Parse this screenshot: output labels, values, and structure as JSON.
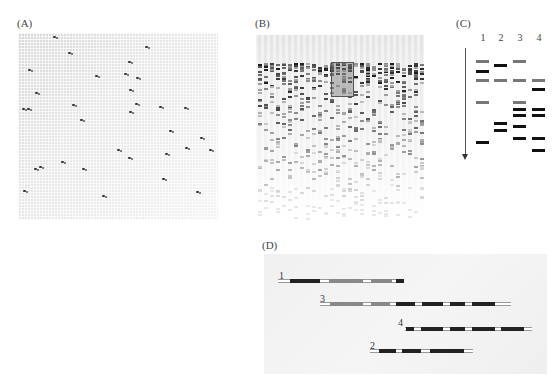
{
  "figure": {
    "panels": [
      {
        "id": "A",
        "label": "(A)",
        "description": "Array grid with scattered hybridization spots"
      },
      {
        "id": "B",
        "label": "(B)",
        "description": "Fingerprint gel with many lanes; highlighted box region"
      },
      {
        "id": "C",
        "label": "(C)",
        "description": "Restriction fingerprint gel of four clones"
      },
      {
        "id": "D",
        "label": "(D)",
        "description": "Contig assembly of four overlapping clones"
      }
    ]
  },
  "panel_a": {
    "label": "(A)",
    "spots": [
      [
        35,
        3
      ],
      [
        50,
        19
      ],
      [
        10,
        36
      ],
      [
        77,
        42
      ],
      [
        106,
        40
      ],
      [
        118,
        44
      ],
      [
        127,
        13
      ],
      [
        110,
        28
      ],
      [
        17,
        59
      ],
      [
        111,
        56
      ],
      [
        117,
        70
      ],
      [
        4,
        75
      ],
      [
        9,
        75
      ],
      [
        54,
        71
      ],
      [
        62,
        86
      ],
      [
        111,
        78
      ],
      [
        141,
        73
      ],
      [
        166,
        74
      ],
      [
        151,
        97
      ],
      [
        182,
        104
      ],
      [
        167,
        114
      ],
      [
        191,
        116
      ],
      [
        99,
        116
      ],
      [
        110,
        124
      ],
      [
        147,
        120
      ],
      [
        43,
        128
      ],
      [
        16,
        135
      ],
      [
        21,
        133
      ],
      [
        64,
        135
      ],
      [
        144,
        145
      ],
      [
        178,
        158
      ],
      [
        84,
        162
      ],
      [
        5,
        157
      ]
    ]
  },
  "panel_b": {
    "label": "(B)",
    "column_count": 28,
    "highlight_box": {
      "x": 75,
      "y": 27,
      "w": 21,
      "h": 33
    }
  },
  "panel_c": {
    "label": "(C)",
    "lanes": [
      {
        "number": "1",
        "x": 16,
        "bands": [
          {
            "y": 30,
            "c": "gray"
          },
          {
            "y": 40,
            "c": "black"
          },
          {
            "y": 49,
            "c": "gray"
          },
          {
            "y": 71,
            "c": "gray"
          },
          {
            "y": 111,
            "c": "black"
          }
        ]
      },
      {
        "number": "2",
        "x": 34,
        "bands": [
          {
            "y": 34,
            "c": "black"
          },
          {
            "y": 49,
            "c": "gray"
          },
          {
            "y": 92,
            "c": "black"
          },
          {
            "y": 99,
            "c": "black"
          }
        ]
      },
      {
        "number": "3",
        "x": 53,
        "bands": [
          {
            "y": 30,
            "c": "gray"
          },
          {
            "y": 49,
            "c": "gray"
          },
          {
            "y": 71,
            "c": "gray"
          },
          {
            "y": 78,
            "c": "black"
          },
          {
            "y": 84,
            "c": "black"
          },
          {
            "y": 95,
            "c": "black"
          },
          {
            "y": 107,
            "c": "black"
          }
        ]
      },
      {
        "number": "4",
        "x": 72,
        "bands": [
          {
            "y": 49,
            "c": "gray"
          },
          {
            "y": 58,
            "c": "black"
          },
          {
            "y": 78,
            "c": "black"
          },
          {
            "y": 84,
            "c": "black"
          },
          {
            "y": 107,
            "c": "black"
          },
          {
            "y": 119,
            "c": "black"
          }
        ]
      }
    ],
    "arrow": "migration direction (down)"
  },
  "panel_d": {
    "label": "(D)",
    "clones": [
      {
        "number": "1",
        "label_x": 15,
        "label_y": 16,
        "line_y": 25,
        "x1": 14,
        "x2": 140,
        "segments": [
          {
            "a": 26,
            "b": 56,
            "c": "black"
          },
          {
            "a": 65,
            "b": 99,
            "c": "gray"
          },
          {
            "a": 107,
            "b": 128,
            "c": "gray"
          },
          {
            "a": 132,
            "b": 140,
            "c": "black"
          }
        ]
      },
      {
        "number": "3",
        "label_x": 56,
        "label_y": 39,
        "line_y": 48,
        "x1": 56,
        "x2": 247,
        "segments": [
          {
            "a": 66,
            "b": 99,
            "c": "gray"
          },
          {
            "a": 107,
            "b": 126,
            "c": "gray"
          },
          {
            "a": 132,
            "b": 151,
            "c": "black"
          },
          {
            "a": 158,
            "b": 179,
            "c": "black"
          },
          {
            "a": 186,
            "b": 201,
            "c": "black"
          },
          {
            "a": 208,
            "b": 231,
            "c": "black"
          }
        ]
      },
      {
        "number": "4",
        "label_x": 134,
        "label_y": 63,
        "line_y": 73,
        "x1": 141,
        "x2": 268,
        "segments": [
          {
            "a": 142,
            "b": 150,
            "c": "black"
          },
          {
            "a": 157,
            "b": 179,
            "c": "black"
          },
          {
            "a": 186,
            "b": 201,
            "c": "black"
          },
          {
            "a": 208,
            "b": 231,
            "c": "black"
          },
          {
            "a": 237,
            "b": 260,
            "c": "black"
          }
        ]
      },
      {
        "number": "2",
        "label_x": 106,
        "label_y": 86,
        "line_y": 95,
        "x1": 106,
        "x2": 209,
        "segments": [
          {
            "a": 115,
            "b": 132,
            "c": "black"
          },
          {
            "a": 138,
            "b": 157,
            "c": "black"
          },
          {
            "a": 166,
            "b": 200,
            "c": "black"
          }
        ]
      }
    ]
  }
}
